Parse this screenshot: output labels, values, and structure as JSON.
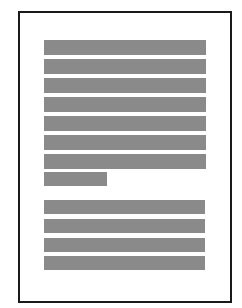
{
  "document": {
    "type": "page-placeholder",
    "frame_color": "#1a1a1a",
    "bar_color": "#8a8a8a",
    "background": "#ffffff",
    "paragraphs": [
      {
        "name": "paragraph-1",
        "lines": [
          {
            "left": 44,
            "top": 40,
            "width": 162,
            "height": 15
          },
          {
            "left": 44,
            "top": 59,
            "width": 162,
            "height": 15
          },
          {
            "left": 44,
            "top": 78,
            "width": 162,
            "height": 15
          },
          {
            "left": 44,
            "top": 97,
            "width": 162,
            "height": 15
          },
          {
            "left": 44,
            "top": 116,
            "width": 162,
            "height": 15
          },
          {
            "left": 44,
            "top": 135,
            "width": 162,
            "height": 15
          },
          {
            "left": 44,
            "top": 154,
            "width": 162,
            "height": 15
          },
          {
            "left": 44,
            "top": 172,
            "width": 63,
            "height": 14
          }
        ]
      },
      {
        "name": "paragraph-2",
        "lines": [
          {
            "left": 44,
            "top": 200,
            "width": 161,
            "height": 14
          },
          {
            "left": 44,
            "top": 219,
            "width": 161,
            "height": 14
          },
          {
            "left": 44,
            "top": 238,
            "width": 161,
            "height": 14
          },
          {
            "left": 44,
            "top": 256,
            "width": 161,
            "height": 14
          }
        ]
      }
    ]
  }
}
